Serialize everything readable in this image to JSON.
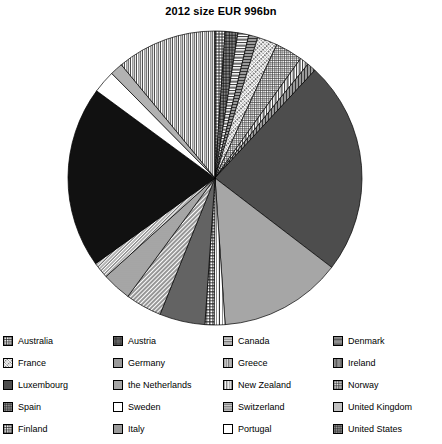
{
  "chart": {
    "title": "2012 size EUR 996bn"
  },
  "chart_data": {
    "type": "pie",
    "title": "2012 size EUR 996bn",
    "total_label": "EUR 996bn",
    "year": "2012",
    "xlabel": "",
    "ylabel": "",
    "legend_position": "bottom",
    "grid": false,
    "start_angle_deg": 0,
    "direction": "clockwise",
    "categories": [
      "Australia",
      "Austria",
      "Canada",
      "Denmark",
      "France",
      "Germany",
      "Greece",
      "Ireland",
      "Luxembourg",
      "the Netherlands",
      "New Zealand",
      "Norway",
      "Spain",
      "Sweden",
      "Switzerland",
      "United Kingdom",
      "Finland",
      "Italy",
      "Portugal",
      "United States"
    ],
    "slices": [
      {
        "label": "Australia",
        "value": 1.1,
        "pattern": "grid-coarse",
        "fill": "#8a8a8a"
      },
      {
        "label": "Austria",
        "value": 1.4,
        "pattern": "crosshatch-dense",
        "fill": "#3a3a3a"
      },
      {
        "label": "Canada",
        "value": 1.2,
        "pattern": "horizontal-lines",
        "fill": "#9e9e9e"
      },
      {
        "label": "Denmark",
        "value": 1.0,
        "pattern": "horizontal-dense",
        "fill": "#4a4a4a"
      },
      {
        "label": "France",
        "value": 2.2,
        "pattern": "diagonal-dashes",
        "fill": "#555555"
      },
      {
        "label": "Germany",
        "value": 3.0,
        "pattern": "grid-fine",
        "fill": "#bdbdbd"
      },
      {
        "label": "Greece",
        "value": 1.0,
        "pattern": "vertical-lines",
        "fill": "#9a9a9a"
      },
      {
        "label": "Ireland",
        "value": 1.0,
        "pattern": "vertical-dense",
        "fill": "#3f3f3f"
      },
      {
        "label": "Luxembourg",
        "value": 23.5,
        "pattern": "solid-dark",
        "fill": "#4d4d4d"
      },
      {
        "label": "the Netherlands",
        "value": 13.5,
        "pattern": "solid-mid",
        "fill": "#a6a6a6"
      },
      {
        "label": "New Zealand",
        "value": 1.2,
        "pattern": "vertical-wide",
        "fill": "#8f8f8f"
      },
      {
        "label": "Norway",
        "value": 1.0,
        "pattern": "grid-medium",
        "fill": "#909090"
      },
      {
        "label": "Spain",
        "value": 5.0,
        "pattern": "crosshatch-grid",
        "fill": "#7d7d7d"
      },
      {
        "label": "Sweden",
        "value": 4.0,
        "pattern": "diagonal-hatch",
        "fill": "#6e6e6e"
      },
      {
        "label": "Switzerland",
        "value": 3.2,
        "pattern": "horizontal-hatch",
        "fill": "#8c8c8c"
      },
      {
        "label": "United Kingdom",
        "value": 1.8,
        "pattern": "diagonal-thin",
        "fill": "#7a7a7a"
      },
      {
        "label": "Finland",
        "value": 20.0,
        "pattern": "solid-black",
        "fill": "#111111"
      },
      {
        "label": "Italy",
        "value": 2.5,
        "pattern": "white-plain",
        "fill": "#ffffff"
      },
      {
        "label": "Portugal",
        "value": 1.4,
        "pattern": "diagonal-fine",
        "fill": "#808080"
      },
      {
        "label": "United States",
        "value": 11.0,
        "pattern": "vertical-medium",
        "fill": "#9c9c9c"
      }
    ]
  },
  "legend": {
    "items": [
      {
        "label": "Australia",
        "swatch": "grid-coarse"
      },
      {
        "label": "Austria",
        "swatch": "crosshatch-dense"
      },
      {
        "label": "Canada",
        "swatch": "horizontal-lines"
      },
      {
        "label": "Denmark",
        "swatch": "horizontal-dense"
      },
      {
        "label": "France",
        "swatch": "diagonal-dashes"
      },
      {
        "label": "Germany",
        "swatch": "grid-fine"
      },
      {
        "label": "Greece",
        "swatch": "vertical-lines"
      },
      {
        "label": "Ireland",
        "swatch": "vertical-dense"
      },
      {
        "label": "Luxembourg",
        "swatch": "solid-dark"
      },
      {
        "label": "the Netherlands",
        "swatch": "solid-mid"
      },
      {
        "label": "New Zealand",
        "swatch": "vertical-wide"
      },
      {
        "label": "Norway",
        "swatch": "grid-medium"
      },
      {
        "label": "Spain",
        "swatch": "crosshatch-grid"
      },
      {
        "label": "Sweden",
        "swatch": "white-plain"
      },
      {
        "label": "Switzerland",
        "swatch": "horizontal-hatch"
      },
      {
        "label": "United Kingdom",
        "swatch": "diagonal-thin"
      },
      {
        "label": "Finland",
        "swatch": "grid-coarse2"
      },
      {
        "label": "Italy",
        "swatch": "grid-fine2"
      },
      {
        "label": "Portugal",
        "swatch": "white-plain"
      },
      {
        "label": "United States",
        "swatch": "crosshatch-grid2"
      }
    ]
  }
}
